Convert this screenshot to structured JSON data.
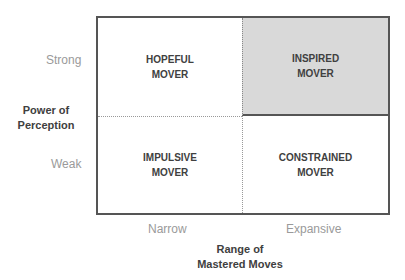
{
  "quadrants": {
    "top_left": [
      "HOPEFUL",
      "MOVER"
    ],
    "top_right": [
      "INSPIRED",
      "MOVER"
    ],
    "bottom_left": [
      "IMPULSIVE",
      "MOVER"
    ],
    "bottom_right": [
      "CONSTRAINED",
      "MOVER"
    ]
  },
  "y_axis": {
    "title": [
      "Power of",
      "Perception"
    ],
    "high": "Strong",
    "low": "Weak"
  },
  "x_axis": {
    "title": [
      "Range of",
      "Mastered Moves"
    ],
    "low": "Narrow",
    "high": "Expansive"
  },
  "colors": {
    "highlight": "#d9d9d9",
    "border": "#555555"
  }
}
